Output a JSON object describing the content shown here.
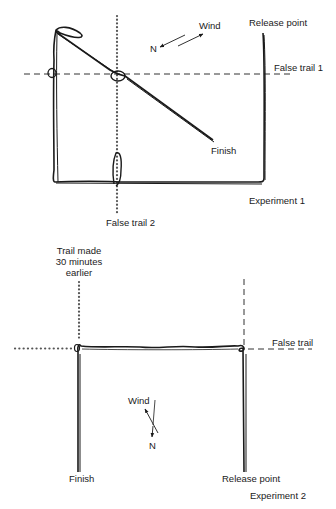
{
  "experiment1": {
    "title": "Experiment 1",
    "release_point": "Release point",
    "wind": "Wind",
    "north": "N",
    "false_trail_1": "False trail 1",
    "false_trail_2": "False trail 2",
    "finish": "Finish"
  },
  "experiment2": {
    "title": "Experiment 2",
    "trail_made_line1": "Trail made",
    "trail_made_line2": "30 minutes",
    "trail_made_line3": "earlier",
    "false_trail": "False trail",
    "wind": "Wind",
    "north": "N",
    "finish": "Finish",
    "release_point": "Release point"
  },
  "colors": {
    "ink": "#1a1a1a",
    "dots": "#555555",
    "background": "#ffffff"
  }
}
